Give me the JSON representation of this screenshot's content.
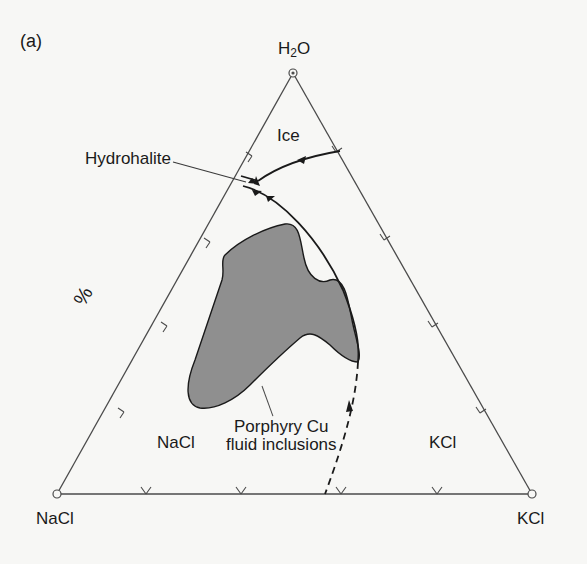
{
  "figure": {
    "panel_label": "(a)",
    "diagram_type": "ternary phase diagram",
    "vertices": {
      "top": {
        "label_main": "H",
        "label_sub": "2",
        "label_tail": "O"
      },
      "bottom_left": "NaCl",
      "bottom_right": "KCl"
    },
    "axis_unit_label": "%",
    "fields": {
      "ice": "Ice",
      "hydrohalite": "Hydrohalite",
      "nacl": "NaCl",
      "kcl": "KCl"
    },
    "annotation": {
      "line1": "Porphyry Cu",
      "line2": "fluid inclusions"
    },
    "colors": {
      "ink": "#2a2a2a",
      "shaded_region": "#8f8f8f",
      "background": "#f7f7f5"
    }
  }
}
